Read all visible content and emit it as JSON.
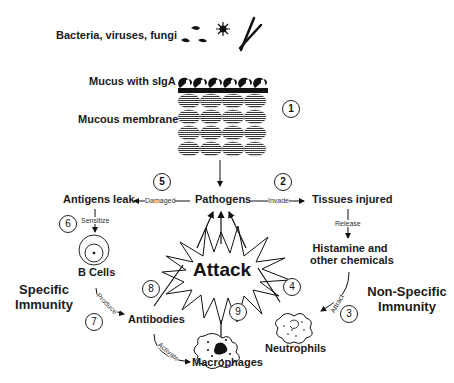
{
  "labels": {
    "pathogens_top": "Bacteria, viruses, fungi",
    "mucus": "Mucus with sIgA",
    "membrane": "Mucous membrane",
    "pathogens": "Pathogens",
    "antigens_leak": "Antigens leak",
    "tissues_injured": "Tissues injured",
    "histamine_line1": "Histamine and",
    "histamine_line2": "other chemicals",
    "b_cells": "B Cells",
    "antibodies": "Antibodies",
    "macrophages": "Macrophages",
    "neutrophils": "Neutrophils",
    "attack": "Attack",
    "specific_line1": "Specific",
    "specific_line2": "Immunity",
    "nonspecific_line1": "Non-Specific",
    "nonspecific_line2": "Immunity"
  },
  "edge_labels": {
    "damaged": "Damaged",
    "invade": "Invade",
    "release": "Release",
    "sensitize": "Sensitize",
    "attract": "Attract",
    "produce": "Produce",
    "activate": "Activate"
  },
  "steps": [
    "1",
    "2",
    "3",
    "4",
    "5",
    "6",
    "7",
    "8",
    "9"
  ],
  "colors": {
    "ink": "#111111",
    "background": "#ffffff"
  }
}
